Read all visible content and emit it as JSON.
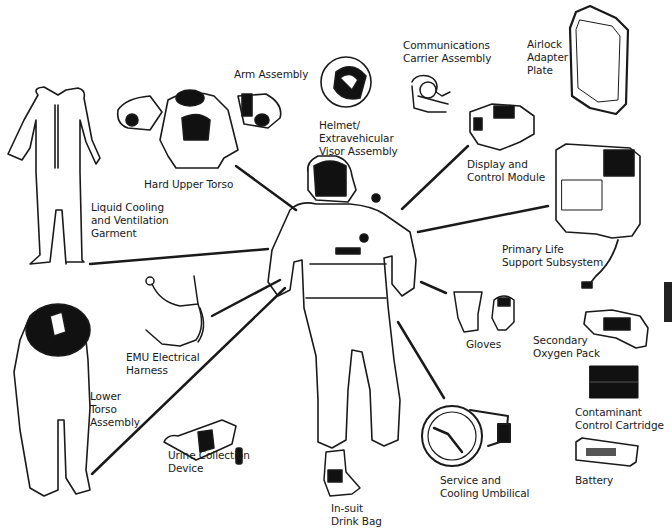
{
  "diagram": {
    "title_visible": false,
    "center": {
      "name": "Extravehicular Mobility Unit (astronaut in suit)"
    },
    "components": [
      {
        "id": "arm-assembly",
        "label": "Arm Assembly",
        "x": 234,
        "y": 68
      },
      {
        "id": "hard-upper-torso",
        "label": "Hard Upper Torso",
        "x": 144,
        "y": 178
      },
      {
        "id": "liquid-cooling-garment",
        "label": "Liquid Cooling\nand Ventilation\nGarment",
        "x": 91,
        "y": 201
      },
      {
        "id": "helmet-evva",
        "label": "Helmet/\nExtravehicular\nVisor Assembly",
        "x": 319,
        "y": 119
      },
      {
        "id": "communications-carrier",
        "label": "Communications\nCarrier Assembly",
        "x": 403,
        "y": 39
      },
      {
        "id": "airlock-adapter-plate",
        "label": "Airlock\nAdapter\nPlate",
        "x": 527,
        "y": 38
      },
      {
        "id": "display-control-module",
        "label": "Display and\nControl Module",
        "x": 467,
        "y": 158
      },
      {
        "id": "primary-life-support",
        "label": "Primary Life\nSupport Subsystem",
        "x": 502,
        "y": 243
      },
      {
        "id": "emu-electrical-harness",
        "label": "EMU Electrical\nHarness",
        "x": 126,
        "y": 351
      },
      {
        "id": "lower-torso-assembly",
        "label": "Lower\nTorso\nAssembly",
        "x": 90,
        "y": 390
      },
      {
        "id": "gloves",
        "label": "Gloves",
        "x": 466,
        "y": 338
      },
      {
        "id": "secondary-oxygen-pack",
        "label": "Secondary\nOxygen Pack",
        "x": 533,
        "y": 334
      },
      {
        "id": "contaminant-control-cartridge",
        "label": "Contaminant\nControl Cartridge",
        "x": 575,
        "y": 406
      },
      {
        "id": "urine-collection-device",
        "label": "Urine Collection\nDevice",
        "x": 168,
        "y": 449
      },
      {
        "id": "service-cooling-umbilical",
        "label": "Service and\nCooling Umbilical",
        "x": 440,
        "y": 474
      },
      {
        "id": "battery",
        "label": "Battery",
        "x": 575,
        "y": 474
      },
      {
        "id": "in-suit-drink-bag",
        "label": "In-suit\nDrink Bag",
        "x": 331,
        "y": 502
      }
    ]
  },
  "colors": {
    "ink": "#1a1a1a",
    "background": "#ffffff",
    "dark_fill": "#111111"
  }
}
